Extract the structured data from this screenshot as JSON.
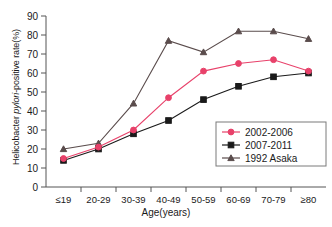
{
  "chart_data": {
    "type": "line",
    "title": "",
    "xlabel": "Age(years)",
    "ylabel": "Helicobacter pylori-positive rate(%)",
    "ylabel_parts": {
      "prefix": "Helicobacter ",
      "italic": "pylori",
      "suffix": "-positive rate(%)"
    },
    "categories": [
      "≤19",
      "20-29",
      "30-39",
      "40-49",
      "50-59",
      "60-69",
      "70-79",
      "≥80"
    ],
    "ylim": [
      0,
      90
    ],
    "yticks": [
      0,
      10,
      20,
      30,
      40,
      50,
      60,
      70,
      80,
      90
    ],
    "grid": false,
    "legend_position": "lower-right",
    "series": [
      {
        "name": "2002-2006",
        "color": "#E8416A",
        "marker": "circle",
        "values": [
          15,
          21,
          30,
          47,
          61,
          65,
          67,
          61
        ]
      },
      {
        "name": "2007-2011",
        "color": "#1a1a1a",
        "marker": "square",
        "values": [
          14,
          20,
          28,
          35,
          46,
          53,
          58,
          60
        ]
      },
      {
        "name": "1992 Asaka",
        "color": "#5a4c4c",
        "marker": "triangle",
        "values": [
          20,
          23,
          44,
          77,
          71,
          82,
          82,
          78
        ]
      }
    ]
  },
  "legend": {
    "items": [
      "2002-2006",
      "2007-2011",
      "1992 Asaka"
    ]
  }
}
